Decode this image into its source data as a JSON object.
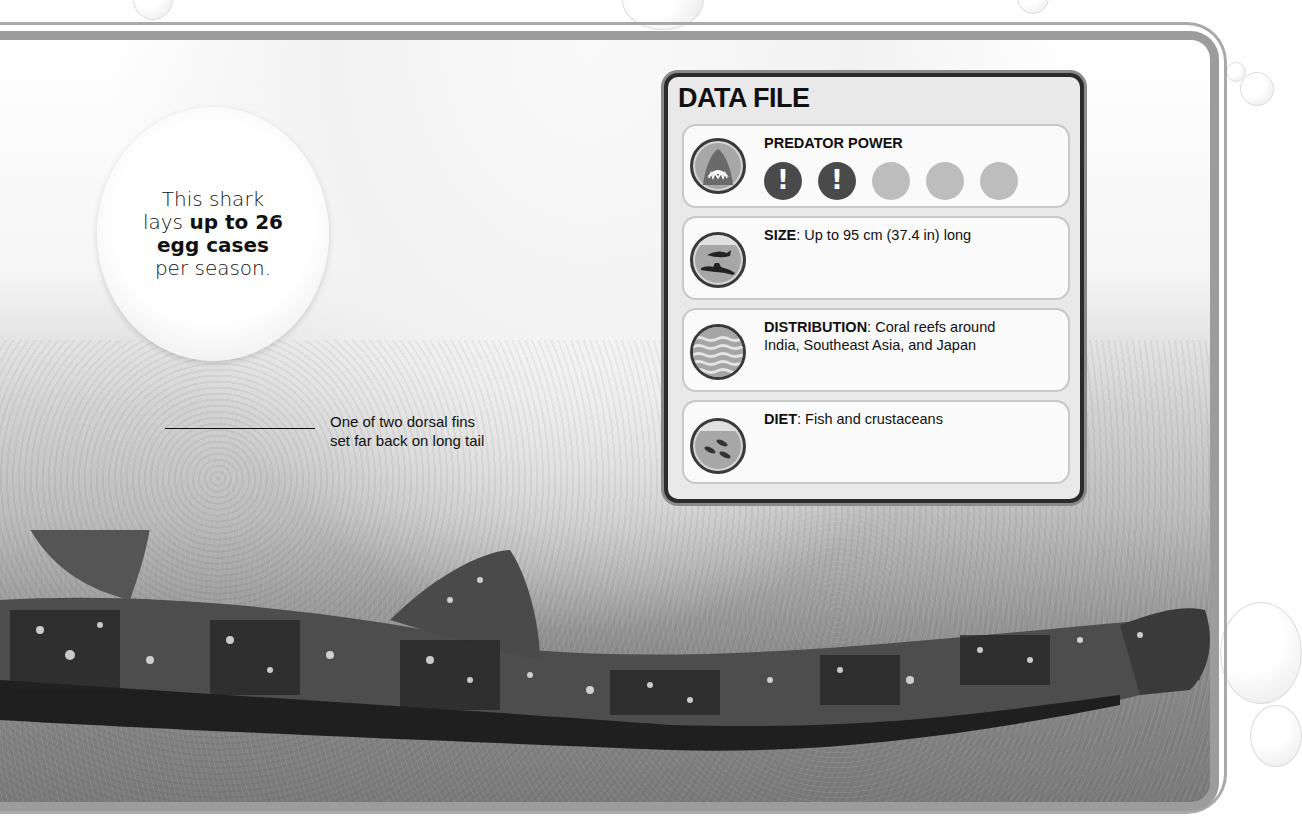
{
  "callout": {
    "line1": "This shark",
    "line2_pre": "lays ",
    "line2_bold": "up to 26",
    "line3_bold": "egg cases",
    "line4": "per season."
  },
  "annotation": {
    "line1": "One of two dorsal fins",
    "line2": "set far back on long tail"
  },
  "data_file": {
    "title": "DATA FILE",
    "predator_power": {
      "label": "PREDATOR POWER",
      "rating": 2,
      "max": 5,
      "icon": "shark-jaws-icon"
    },
    "size": {
      "label": "SIZE",
      "value": ": Up to 95 cm (37.4 in) long",
      "icon": "diver-and-shark-icon"
    },
    "distribution": {
      "label": "DISTRIBUTION",
      "value_line1": ": Coral reefs around",
      "value_line2": "India, Southeast Asia, and Japan",
      "icon": "waves-icon"
    },
    "diet": {
      "label": "DIET",
      "value": ": Fish and crustaceans",
      "icon": "fish-school-icon"
    }
  }
}
